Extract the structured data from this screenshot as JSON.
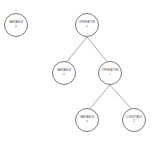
{
  "diagram": {
    "kind": "expression-tree",
    "nodes": [
      {
        "id": "n1",
        "type": "VARIABLE",
        "value": "y",
        "cx": 16,
        "cy": 25
      },
      {
        "id": "n2",
        "type": "OPERATOR",
        "value": "=",
        "cx": 87,
        "cy": 25
      },
      {
        "id": "n3",
        "type": "VARIABLE",
        "value": "x",
        "cx": 64,
        "cy": 73
      },
      {
        "id": "n4",
        "type": "OPERATOR",
        "value": "+",
        "cx": 110,
        "cy": 73
      },
      {
        "id": "n5",
        "type": "VARIABLE",
        "value": "x",
        "cx": 87,
        "cy": 120
      },
      {
        "id": "n6",
        "type": "CONSTANT",
        "value": "2",
        "cx": 134,
        "cy": 120
      }
    ],
    "edges": [
      {
        "from": "n2",
        "to": "n3"
      },
      {
        "from": "n2",
        "to": "n4"
      },
      {
        "from": "n4",
        "to": "n5"
      },
      {
        "from": "n4",
        "to": "n6"
      }
    ],
    "colors": {
      "stroke": "#7a7a7a",
      "text": "#555555",
      "background": "#ffffff"
    }
  }
}
